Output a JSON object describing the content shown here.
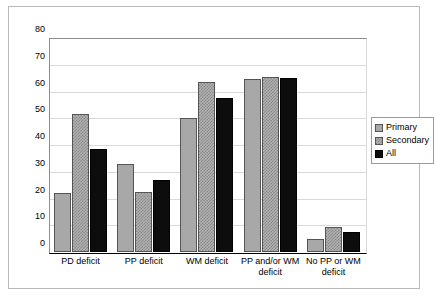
{
  "chart_data": {
    "type": "bar",
    "title": "",
    "subtitle": "",
    "xlabel": "",
    "ylabel": "",
    "ylim": [
      0,
      80
    ],
    "yticks": [
      0,
      10,
      20,
      30,
      40,
      50,
      60,
      70,
      80
    ],
    "ytick_labels": [
      "0",
      "10",
      "20",
      "30",
      "40",
      "50",
      "60",
      "70",
      "80"
    ],
    "grid": true,
    "legend_position": "right",
    "categories": [
      "PD deficit",
      "PP deficit",
      "WM deficit",
      "PP and/or WM deficit",
      "No PP or WM deficit"
    ],
    "series": [
      {
        "name": "Primary",
        "color": "#a8a8a8",
        "pattern": "solid",
        "values": [
          22,
          33,
          50,
          64.5,
          5
        ]
      },
      {
        "name": "Secondary",
        "color": "#b0b0b0",
        "pattern": "checkered",
        "values": [
          51.5,
          22.5,
          63.5,
          65.5,
          9.5
        ]
      },
      {
        "name": "All",
        "color": "#0d0d0d",
        "pattern": "solid",
        "values": [
          38.5,
          27,
          57.5,
          65,
          7.5
        ]
      }
    ]
  },
  "legend": {
    "entries": [
      {
        "label": "Primary"
      },
      {
        "label": "Secondary"
      },
      {
        "label": "All"
      }
    ]
  }
}
